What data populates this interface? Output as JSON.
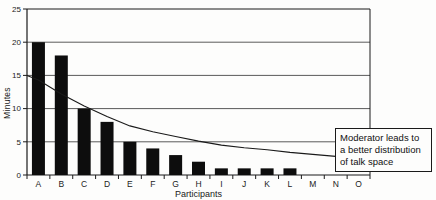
{
  "chart_data": {
    "type": "bar",
    "title": "",
    "categories": [
      "A",
      "B",
      "C",
      "D",
      "E",
      "F",
      "G",
      "H",
      "I",
      "J",
      "K",
      "L",
      "M",
      "N",
      "O"
    ],
    "series": [
      {
        "name": "talk-time-bars",
        "type": "bar",
        "values": [
          20,
          18,
          10,
          8,
          5,
          4,
          3,
          2,
          1,
          1,
          1,
          1,
          0,
          0,
          0
        ]
      },
      {
        "name": "moderated-distribution-line",
        "type": "line",
        "start_at_axis_value": 15,
        "values": [
          14.3,
          12.2,
          10.4,
          8.8,
          7.4,
          6.5,
          5.8,
          5.1,
          4.5,
          4.1,
          3.8,
          3.4,
          3.1,
          2.8,
          2.5
        ]
      }
    ],
    "xlabel": "Participants",
    "ylabel": "Minutes",
    "ylim": [
      0,
      25
    ],
    "yticks": [
      0,
      5,
      10,
      15,
      20,
      25
    ],
    "grid": true,
    "legend": "none",
    "annotation": "Moderator leads to a better distribution of talk space"
  },
  "annotation_box": {
    "lines": [
      "Moderator leads to",
      "a better distribution",
      "of talk space"
    ]
  },
  "colors": {
    "background": "#fdfdfc",
    "bar": "#0d0d0d",
    "line": "#1a1a1a",
    "grid": "#5a5a5a",
    "axis": "#1a1a1a",
    "text": "#1a1a1a"
  }
}
